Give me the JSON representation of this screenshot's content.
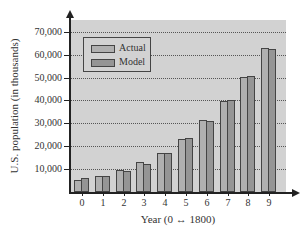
{
  "chart_data": {
    "type": "bar",
    "title": "",
    "xlabel": "Year (0 ↔ 1800)",
    "ylabel": "U.S. population (in thousands)",
    "categories": [
      "0",
      "1",
      "2",
      "3",
      "4",
      "5",
      "6",
      "7",
      "8",
      "9"
    ],
    "series": [
      {
        "name": "Actual",
        "color": "#b0b0b0",
        "values": [
          5300,
          7200,
          9600,
          12900,
          17100,
          23200,
          31400,
          39800,
          50200,
          62900
        ]
      },
      {
        "name": "Model",
        "color": "#959595",
        "values": [
          5900,
          6900,
          9100,
          12300,
          17200,
          23600,
          31200,
          40300,
          50500,
          62400
        ]
      }
    ],
    "yticks": [
      "10,000",
      "20,000",
      "30,000",
      "40,000",
      "50,000",
      "60,000",
      "70,000"
    ],
    "ylim": [
      0,
      75000
    ],
    "grid": true,
    "legend_position": "upper left"
  }
}
